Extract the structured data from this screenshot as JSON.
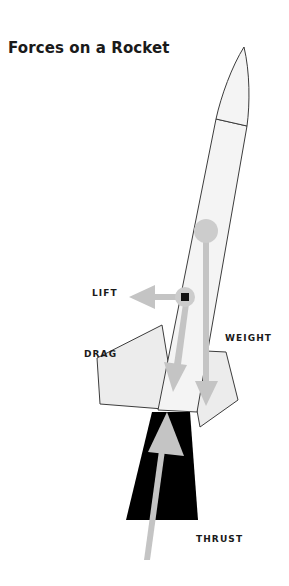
{
  "figure": {
    "title": "Forces on a Rocket",
    "background_color": "#ffffff",
    "width": 289,
    "height": 586
  },
  "labels": {
    "lift": "LIFT",
    "drag": "DRAG",
    "weight": "WEIGHT",
    "thrust": "THRUST"
  },
  "colors": {
    "body_fill": "#f4f4f4",
    "fin_fill": "#ececec",
    "outline": "#3c3c3c",
    "arrow_gray": "#c4c4c4",
    "marker_gray": "#cccccc",
    "exhaust_black": "#000000",
    "text": "#1a1a1a"
  },
  "parts": {
    "nose_cone": "nose-cone",
    "body_tube": "body-tube",
    "left_fin": "left-fin",
    "right_fin": "right-fin",
    "exhaust_plume": "exhaust-plume",
    "center_of_pressure": "center-of-pressure-marker",
    "center_of_gravity": "center-of-gravity-marker"
  },
  "arrows": {
    "lift": "lift-arrow",
    "drag": "drag-arrow",
    "weight": "weight-arrow",
    "thrust": "thrust-arrow"
  }
}
